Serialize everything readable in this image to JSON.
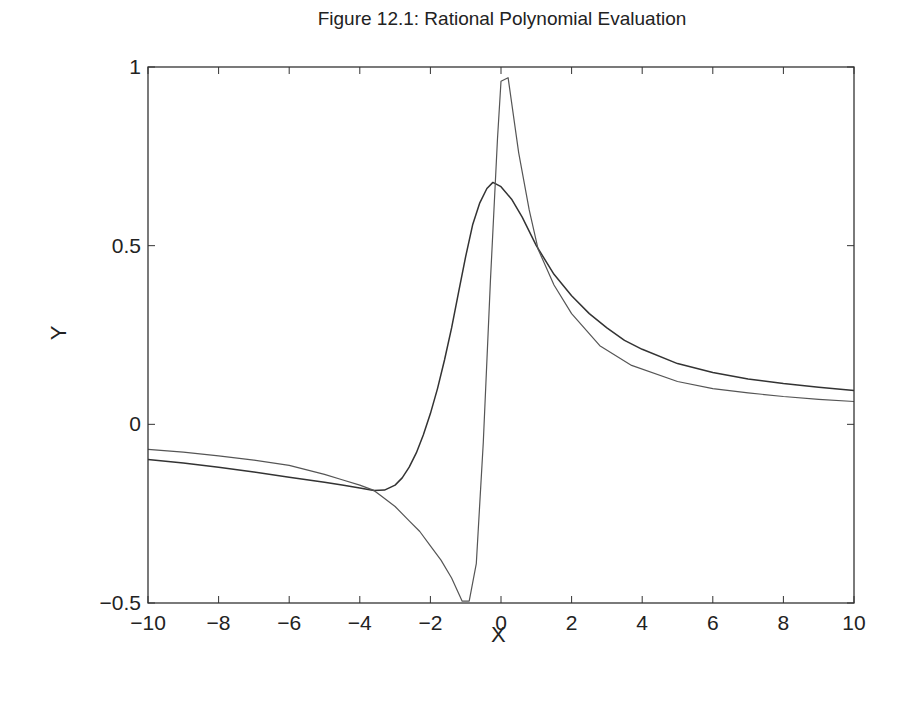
{
  "figure": {
    "title": "Figure 12.1: Rational Polynomial Evaluation",
    "xlabel": "X",
    "ylabel": "Y"
  },
  "chart_data": {
    "type": "line",
    "title": "Figure 12.1: Rational Polynomial Evaluation",
    "xlabel": "X",
    "ylabel": "Y",
    "xlim": [
      -10,
      10
    ],
    "ylim": [
      -0.5,
      1
    ],
    "xticks": [
      -10,
      -8,
      -6,
      -4,
      -2,
      0,
      2,
      4,
      6,
      8,
      10
    ],
    "xtick_labels": [
      "−10",
      "−8",
      "−6",
      "−4",
      "−2",
      "0",
      "2",
      "4",
      "6",
      "8",
      "10"
    ],
    "yticks": [
      -0.5,
      0,
      0.5,
      1
    ],
    "ytick_labels": [
      "−0.5",
      "0",
      "0.5",
      "1"
    ],
    "grid": false,
    "legend": null,
    "series": [
      {
        "name": "smooth rational curve",
        "style": "solid",
        "color": "#333333",
        "x": [
          -10,
          -9,
          -8,
          -7,
          -6,
          -5,
          -4.5,
          -4,
          -3.6,
          -3.3,
          -3.0,
          -2.8,
          -2.6,
          -2.4,
          -2.2,
          -2.0,
          -1.8,
          -1.6,
          -1.4,
          -1.2,
          -1.0,
          -0.8,
          -0.6,
          -0.4,
          -0.23,
          0.0,
          0.3,
          0.6,
          1.0,
          1.5,
          2.0,
          2.5,
          3.0,
          3.5,
          4.0,
          5.0,
          6.0,
          7.0,
          8.0,
          9.0,
          10.0
        ],
        "y": [
          -0.098,
          -0.108,
          -0.12,
          -0.133,
          -0.148,
          -0.162,
          -0.17,
          -0.178,
          -0.185,
          -0.184,
          -0.17,
          -0.15,
          -0.12,
          -0.08,
          -0.03,
          0.03,
          0.1,
          0.18,
          0.27,
          0.37,
          0.47,
          0.56,
          0.62,
          0.66,
          0.677,
          0.665,
          0.63,
          0.58,
          0.5,
          0.42,
          0.36,
          0.31,
          0.27,
          0.235,
          0.21,
          0.17,
          0.145,
          0.127,
          0.114,
          0.104,
          0.095
        ]
      },
      {
        "name": "sharp rational curve",
        "style": "dotted",
        "color": "#555555",
        "x": [
          -10,
          -9,
          -8,
          -7,
          -6,
          -5,
          -4.5,
          -4,
          -3.6,
          -3.4,
          -3.0,
          -2.6,
          -2.3,
          -2.0,
          -1.7,
          -1.4,
          -1.1,
          -0.9,
          -0.7,
          -0.5,
          -0.3,
          -0.1,
          0.0,
          0.2,
          0.5,
          0.8,
          1.05,
          1.5,
          2.0,
          2.8,
          3.7,
          5.0,
          6.0,
          7.0,
          8.0,
          9.0,
          10.0
        ],
        "y": [
          -0.07,
          -0.078,
          -0.088,
          -0.1,
          -0.115,
          -0.14,
          -0.155,
          -0.17,
          -0.185,
          -0.2,
          -0.23,
          -0.27,
          -0.3,
          -0.34,
          -0.38,
          -0.43,
          -0.495,
          -0.495,
          -0.39,
          -0.05,
          0.4,
          0.8,
          0.96,
          0.97,
          0.76,
          0.6,
          0.49,
          0.39,
          0.31,
          0.22,
          0.165,
          0.12,
          0.1,
          0.088,
          0.078,
          0.07,
          0.064
        ]
      }
    ]
  },
  "layout": {
    "plot_left": 148,
    "plot_right": 854,
    "plot_top": 67,
    "plot_bottom": 603
  }
}
